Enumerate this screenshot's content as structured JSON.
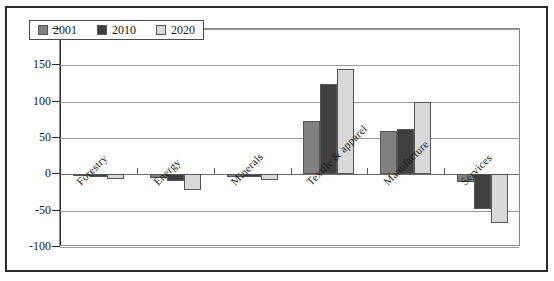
{
  "chart_data": {
    "type": "bar",
    "title": "",
    "subtitle": "",
    "xlabel": "",
    "ylabel": "",
    "ylim": [
      -100,
      200
    ],
    "yticks": [
      200,
      150,
      100,
      50,
      0,
      -50,
      -100
    ],
    "ytick_labels": [
      "200",
      "150",
      "100",
      "50",
      "0",
      "-50",
      "-100"
    ],
    "grid": true,
    "legend_position": "top-left",
    "categories": [
      "Forestry",
      "Energy",
      "Minerals",
      "Textile & apparel",
      "Manufacture",
      "Services"
    ],
    "series": [
      {
        "name": "2001",
        "color": "#808080",
        "values": [
          -2,
          -5,
          -3,
          73,
          60,
          -10
        ]
      },
      {
        "name": "2010",
        "color": "#3f3f3f",
        "values": [
          -3,
          -9,
          -4,
          125,
          62,
          -48
        ]
      },
      {
        "name": "2020",
        "color": "#d9d9d9",
        "values": [
          -7,
          -22,
          -8,
          145,
          100,
          -67
        ]
      }
    ]
  },
  "legend": {
    "entries": [
      {
        "label": "2001"
      },
      {
        "label": "2010"
      },
      {
        "label": "2020"
      }
    ]
  }
}
